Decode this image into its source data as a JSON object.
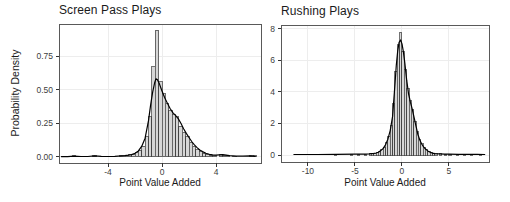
{
  "figure": {
    "background": "#ffffff",
    "colors": {
      "panel_border": "#595959",
      "grid": "#ededed",
      "tick": "#333333",
      "tick_label": "#404040",
      "text": "#1a1a1a",
      "bar_fill": "#d6d6d6",
      "bar_stroke": "#383838",
      "curve": "#000000"
    }
  },
  "chart_data": [
    {
      "type": "bar",
      "subtype": "histogram_with_density_overlay",
      "title": "Screen Pass Plays",
      "xlabel": "Point Value Added",
      "ylabel": "Probability Density",
      "xlim": [
        -7.63,
        7.33
      ],
      "ylim": [
        -0.0446,
        0.988
      ],
      "grid": "on",
      "legend": "none",
      "binwidth": 0.25,
      "x_ticks": [
        {
          "v": -4,
          "label": "-4"
        },
        {
          "v": 0,
          "label": "0"
        },
        {
          "v": 4,
          "label": "4"
        }
      ],
      "y_ticks": [
        {
          "v": 0.0,
          "label": "0.00"
        },
        {
          "v": 0.25,
          "label": "0.25"
        },
        {
          "v": 0.5,
          "label": "0.50"
        },
        {
          "v": 0.75,
          "label": "0.75"
        }
      ],
      "bars": [
        [
          -6.5,
          0.008
        ],
        [
          -5.0,
          0.01
        ],
        [
          -3.9,
          0.006
        ],
        [
          -3.0,
          0.009
        ],
        [
          -2.625,
          0.012
        ],
        [
          -2.375,
          0.016
        ],
        [
          -2.125,
          0.022
        ],
        [
          -1.875,
          0.032
        ],
        [
          -1.625,
          0.05
        ],
        [
          -1.375,
          0.08
        ],
        [
          -1.125,
          0.15
        ],
        [
          -0.875,
          0.3
        ],
        [
          -0.625,
          0.67
        ],
        [
          -0.375,
          0.94
        ],
        [
          -0.125,
          0.56
        ],
        [
          0.125,
          0.47
        ],
        [
          0.375,
          0.4
        ],
        [
          0.625,
          0.345
        ],
        [
          0.875,
          0.315
        ],
        [
          1.125,
          0.3
        ],
        [
          1.375,
          0.23
        ],
        [
          1.625,
          0.185
        ],
        [
          1.875,
          0.15
        ],
        [
          2.125,
          0.11
        ],
        [
          2.375,
          0.08
        ],
        [
          2.625,
          0.055
        ],
        [
          2.875,
          0.038
        ],
        [
          3.125,
          0.026
        ],
        [
          3.375,
          0.019
        ],
        [
          3.625,
          0.013
        ],
        [
          3.875,
          0.01
        ],
        [
          4.375,
          0.02
        ],
        [
          4.625,
          0.012
        ],
        [
          4.875,
          0.008
        ],
        [
          5.375,
          0.007
        ],
        [
          6.625,
          0.012
        ],
        [
          6.875,
          0.008
        ]
      ],
      "curve": [
        [
          -7.45,
          0.003
        ],
        [
          -7.0,
          0.003
        ],
        [
          -6.5,
          0.006
        ],
        [
          -6.0,
          0.004
        ],
        [
          -5.5,
          0.004
        ],
        [
          -5.0,
          0.008
        ],
        [
          -4.5,
          0.005
        ],
        [
          -4.0,
          0.004
        ],
        [
          -3.5,
          0.005
        ],
        [
          -3.0,
          0.008
        ],
        [
          -2.75,
          0.01
        ],
        [
          -2.5,
          0.013
        ],
        [
          -2.25,
          0.018
        ],
        [
          -2.0,
          0.028
        ],
        [
          -1.75,
          0.045
        ],
        [
          -1.5,
          0.08
        ],
        [
          -1.25,
          0.14
        ],
        [
          -1.0,
          0.27
        ],
        [
          -0.85,
          0.38
        ],
        [
          -0.7,
          0.48
        ],
        [
          -0.55,
          0.55
        ],
        [
          -0.45,
          0.58
        ],
        [
          -0.35,
          0.575
        ],
        [
          -0.2,
          0.545
        ],
        [
          0.0,
          0.49
        ],
        [
          0.2,
          0.44
        ],
        [
          0.4,
          0.4
        ],
        [
          0.6,
          0.36
        ],
        [
          0.8,
          0.33
        ],
        [
          1.0,
          0.31
        ],
        [
          1.2,
          0.285
        ],
        [
          1.4,
          0.25
        ],
        [
          1.6,
          0.21
        ],
        [
          1.8,
          0.175
        ],
        [
          2.0,
          0.145
        ],
        [
          2.2,
          0.115
        ],
        [
          2.4,
          0.09
        ],
        [
          2.6,
          0.07
        ],
        [
          2.8,
          0.052
        ],
        [
          3.0,
          0.04
        ],
        [
          3.25,
          0.028
        ],
        [
          3.5,
          0.02
        ],
        [
          3.75,
          0.016
        ],
        [
          4.0,
          0.014
        ],
        [
          4.25,
          0.016
        ],
        [
          4.5,
          0.018
        ],
        [
          4.75,
          0.014
        ],
        [
          5.0,
          0.01
        ],
        [
          5.5,
          0.007
        ],
        [
          6.0,
          0.006
        ],
        [
          6.5,
          0.008
        ],
        [
          6.9,
          0.005
        ]
      ]
    },
    {
      "type": "bar",
      "subtype": "histogram_with_density_overlay",
      "title": "Rushing Plays",
      "xlabel": "Point Value Added",
      "ylabel": "",
      "xlim": [
        -12.87,
        9.26
      ],
      "ylim": [
        -0.0444,
        0.825
      ],
      "grid": "on",
      "legend": "none",
      "binwidth": 0.25,
      "x_ticks": [
        {
          "v": -10,
          "label": "-10"
        },
        {
          "v": -5,
          "label": "-5"
        },
        {
          "v": 0,
          "label": "0"
        },
        {
          "v": 5,
          "label": "5"
        }
      ],
      "y_ticks": [
        {
          "v": 0.0,
          "label": "0.0"
        },
        {
          "v": 0.2,
          "label": "0.2"
        },
        {
          "v": 0.4,
          "label": "0.4"
        },
        {
          "v": 0.6,
          "label": "0.6"
        },
        {
          "v": 0.8,
          "label": "0.8"
        }
      ],
      "bars": [
        [
          -7.1,
          0.005
        ],
        [
          -5.4,
          0.005
        ],
        [
          -4.6,
          0.006
        ],
        [
          -3.9,
          0.006
        ],
        [
          -3.375,
          0.007
        ],
        [
          -3.125,
          0.009
        ],
        [
          -2.875,
          0.012
        ],
        [
          -2.625,
          0.015
        ],
        [
          -2.375,
          0.02
        ],
        [
          -2.125,
          0.032
        ],
        [
          -1.875,
          0.05
        ],
        [
          -1.625,
          0.078
        ],
        [
          -1.375,
          0.118
        ],
        [
          -1.125,
          0.19
        ],
        [
          -0.875,
          0.33
        ],
        [
          -0.625,
          0.53
        ],
        [
          -0.375,
          0.7
        ],
        [
          -0.125,
          0.78
        ],
        [
          0.125,
          0.66
        ],
        [
          0.375,
          0.54
        ],
        [
          0.625,
          0.42
        ],
        [
          0.875,
          0.345
        ],
        [
          1.125,
          0.29
        ],
        [
          1.375,
          0.215
        ],
        [
          1.625,
          0.15
        ],
        [
          1.875,
          0.1
        ],
        [
          2.125,
          0.07
        ],
        [
          2.375,
          0.048
        ],
        [
          2.625,
          0.032
        ],
        [
          2.875,
          0.022
        ],
        [
          3.125,
          0.014
        ],
        [
          3.375,
          0.01
        ],
        [
          3.625,
          0.008
        ],
        [
          4.125,
          0.007
        ],
        [
          4.625,
          0.006
        ],
        [
          5.125,
          0.005
        ],
        [
          5.875,
          0.005
        ],
        [
          6.625,
          0.004
        ],
        [
          7.375,
          0.004
        ],
        [
          8.375,
          0.004
        ]
      ],
      "curve": [
        [
          -11.5,
          0.003
        ],
        [
          -10.0,
          0.003
        ],
        [
          -9.0,
          0.003
        ],
        [
          -7.0,
          0.004
        ],
        [
          -5.0,
          0.005
        ],
        [
          -4.0,
          0.006
        ],
        [
          -3.5,
          0.007
        ],
        [
          -3.0,
          0.01
        ],
        [
          -2.75,
          0.013
        ],
        [
          -2.5,
          0.018
        ],
        [
          -2.25,
          0.028
        ],
        [
          -2.0,
          0.042
        ],
        [
          -1.75,
          0.065
        ],
        [
          -1.5,
          0.1
        ],
        [
          -1.25,
          0.155
        ],
        [
          -1.0,
          0.245
        ],
        [
          -0.8,
          0.4
        ],
        [
          -0.6,
          0.57
        ],
        [
          -0.45,
          0.66
        ],
        [
          -0.3,
          0.715
        ],
        [
          -0.15,
          0.73
        ],
        [
          0.0,
          0.705
        ],
        [
          0.15,
          0.655
        ],
        [
          0.3,
          0.585
        ],
        [
          0.5,
          0.475
        ],
        [
          0.7,
          0.39
        ],
        [
          0.9,
          0.335
        ],
        [
          1.1,
          0.29
        ],
        [
          1.3,
          0.235
        ],
        [
          1.5,
          0.18
        ],
        [
          1.7,
          0.13
        ],
        [
          1.9,
          0.095
        ],
        [
          2.1,
          0.07
        ],
        [
          2.3,
          0.052
        ],
        [
          2.5,
          0.038
        ],
        [
          2.75,
          0.026
        ],
        [
          3.0,
          0.017
        ],
        [
          3.25,
          0.012
        ],
        [
          3.5,
          0.009
        ],
        [
          4.0,
          0.007
        ],
        [
          4.5,
          0.006
        ],
        [
          5.0,
          0.005
        ],
        [
          6.0,
          0.004
        ],
        [
          7.0,
          0.004
        ],
        [
          8.0,
          0.004
        ],
        [
          8.8,
          0.003
        ]
      ]
    }
  ]
}
